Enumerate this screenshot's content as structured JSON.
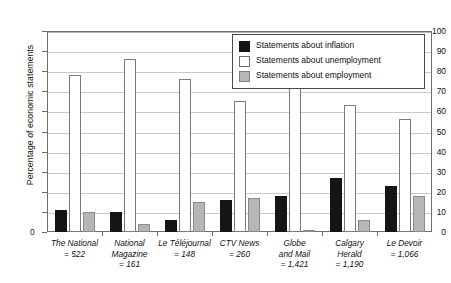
{
  "chart_data": {
    "type": "bar",
    "title": "",
    "xlabel": "",
    "ylabel": "Percentage of economic statements",
    "ylim": [
      0,
      100
    ],
    "ytick_step": 10,
    "yticks": [
      "0",
      "10",
      "20",
      "30",
      "40",
      "50",
      "60",
      "70",
      "80",
      "90",
      "100"
    ],
    "grid": true,
    "legend_position": "top-right",
    "categories": [
      "The National",
      "National Magazine",
      "Le Téléjournal",
      "CTV News",
      "Globe and Mail",
      "Calgary Herald",
      "Le Devoir"
    ],
    "category_labels": [
      {
        "name": "The National",
        "count": "= 522",
        "lines": [
          "The National"
        ]
      },
      {
        "name": "National Magazine",
        "count": "= 161",
        "lines": [
          "National",
          "Magazine"
        ]
      },
      {
        "name": "Le Téléjournal",
        "count": "= 148",
        "lines": [
          "Le Téléjournal"
        ]
      },
      {
        "name": "CTV News",
        "count": "= 260",
        "lines": [
          "CTV News"
        ]
      },
      {
        "name": "Globe and Mail",
        "count": "= 1,421",
        "lines": [
          "Globe",
          "and Mail"
        ]
      },
      {
        "name": "Calgary Herald",
        "count": "= 1,190",
        "lines": [
          "Calgary",
          "Herald"
        ]
      },
      {
        "name": "Le Devoir",
        "count": "= 1,066",
        "lines": [
          "Le Devoir"
        ]
      }
    ],
    "series": [
      {
        "name": "Statements about inflation",
        "color": "#151515",
        "values": [
          11,
          10,
          6,
          16,
          18,
          27,
          23
        ]
      },
      {
        "name": "Statements about unemployment",
        "color": "#ffffff",
        "values": [
          78,
          86,
          76,
          65,
          79,
          63,
          56
        ]
      },
      {
        "name": "Statements about employment",
        "color": "#b6b6b6",
        "values": [
          10,
          4,
          15,
          17,
          1,
          6,
          18
        ]
      }
    ]
  },
  "legend": {
    "items": [
      {
        "label": "Statements about inflation",
        "key": "inflation"
      },
      {
        "label": "Statements about unemployment",
        "key": "unemployment"
      },
      {
        "label": "Statements about employment",
        "key": "employment"
      }
    ]
  }
}
